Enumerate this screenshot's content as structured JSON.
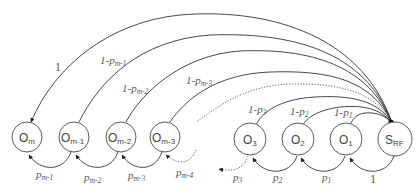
{
  "diagram": {
    "type": "state-transition",
    "nodes": [
      {
        "id": "Om",
        "label": "O",
        "sub": "m",
        "cx": 27,
        "cy": 137
      },
      {
        "id": "Om1",
        "label": "O",
        "sub": "m-1",
        "cx": 74,
        "cy": 137
      },
      {
        "id": "Om2",
        "label": "O",
        "sub": "m-2",
        "cx": 121,
        "cy": 137
      },
      {
        "id": "Om3",
        "label": "O",
        "sub": "m-3",
        "cx": 165,
        "cy": 137
      },
      {
        "id": "O3",
        "label": "O",
        "sub": "3",
        "cx": 250,
        "cy": 139
      },
      {
        "id": "O2",
        "label": "O",
        "sub": "2",
        "cx": 298,
        "cy": 139
      },
      {
        "id": "O1",
        "label": "O",
        "sub": "1",
        "cx": 346,
        "cy": 139
      },
      {
        "id": "SRF",
        "label": "S",
        "sub": "RF",
        "cx": 395,
        "cy": 139
      }
    ],
    "top_edges": [
      {
        "from": "SRF",
        "to": "Om",
        "label": "1",
        "label_sub": "",
        "style": "solid"
      },
      {
        "from": "SRF",
        "to": "Om1",
        "label": "1-p",
        "label_sub": "m-1",
        "style": "solid"
      },
      {
        "from": "SRF",
        "to": "Om2",
        "label": "1-p",
        "label_sub": "m-2",
        "style": "solid"
      },
      {
        "from": "SRF",
        "to": "Om3",
        "label": "1-p",
        "label_sub": "m-3",
        "style": "solid"
      },
      {
        "from": "SRF",
        "to": "...",
        "label": "",
        "label_sub": "",
        "style": "dotted"
      },
      {
        "from": "SRF",
        "to": "O3",
        "label": "1-p",
        "label_sub": "3",
        "style": "solid"
      },
      {
        "from": "SRF",
        "to": "O2",
        "label": "1-p",
        "label_sub": "2",
        "style": "solid"
      },
      {
        "from": "SRF",
        "to": "O1",
        "label": "1-p",
        "label_sub": "1",
        "style": "solid"
      }
    ],
    "bottom_edges": [
      {
        "from": "Om1",
        "to": "Om",
        "label": "p",
        "label_sub": "m-1",
        "style": "solid"
      },
      {
        "from": "Om2",
        "to": "Om1",
        "label": "p",
        "label_sub": "m-2",
        "style": "solid"
      },
      {
        "from": "Om3",
        "to": "Om2",
        "label": "p",
        "label_sub": "m-3",
        "style": "solid"
      },
      {
        "from": "...",
        "to": "Om3",
        "label": "p",
        "label_sub": "m-4",
        "style": "dotted"
      },
      {
        "from": "O3",
        "to": "...",
        "label": "p",
        "label_sub": "3",
        "style": "dotted"
      },
      {
        "from": "O2",
        "to": "O3",
        "label": "p",
        "label_sub": "2",
        "style": "solid"
      },
      {
        "from": "O1",
        "to": "O2",
        "label": "p",
        "label_sub": "1",
        "style": "solid"
      },
      {
        "from": "SRF",
        "to": "O1",
        "label": "1",
        "label_sub": "",
        "style": "solid"
      }
    ]
  },
  "labels": {
    "n_Om": {
      "main": "O",
      "sub": "m"
    },
    "n_Om1": {
      "main": "O",
      "sub": "m-1"
    },
    "n_Om2": {
      "main": "O",
      "sub": "m-2"
    },
    "n_Om3": {
      "main": "O",
      "sub": "m-3"
    },
    "n_O3": {
      "main": "O",
      "sub": "3"
    },
    "n_O2": {
      "main": "O",
      "sub": "2"
    },
    "n_O1": {
      "main": "O",
      "sub": "1"
    },
    "n_SRF": {
      "main": "S",
      "sub": "RF"
    },
    "t_Om": {
      "main": "1"
    },
    "t_Om1": {
      "main": "1-p",
      "sub": "m-1"
    },
    "t_Om2": {
      "main": "1-p",
      "sub": "m-2"
    },
    "t_Om3": {
      "main": "1-p",
      "sub": "m-3"
    },
    "t_O3": {
      "main": "1-p",
      "sub": "3"
    },
    "t_O2": {
      "main": "1-p",
      "sub": "2"
    },
    "t_O1": {
      "main": "1-p",
      "sub": "1"
    },
    "b_m1": {
      "main": "p",
      "sub": "m-1"
    },
    "b_m2": {
      "main": "p",
      "sub": "m-2"
    },
    "b_m3": {
      "main": "p",
      "sub": "m-3"
    },
    "b_m4": {
      "main": "p",
      "sub": "m-4"
    },
    "b_3": {
      "main": "p",
      "sub": "3"
    },
    "b_2": {
      "main": "p",
      "sub": "2"
    },
    "b_1": {
      "main": "p",
      "sub": "1"
    },
    "b_srf": {
      "main": "1"
    }
  },
  "colors": {
    "stroke": "#333333",
    "node_stroke": "#5a5a5a",
    "text": "#555555",
    "background": "#ffffff"
  }
}
